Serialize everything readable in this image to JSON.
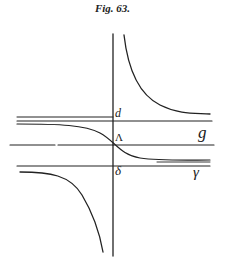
{
  "figure": {
    "title": "Fig. 63.",
    "labels": {
      "d": "d",
      "lambda": "Λ",
      "delta": "δ",
      "g": "g",
      "gamma": "γ"
    },
    "ink_color": "#222222",
    "background": "#ffffff"
  }
}
